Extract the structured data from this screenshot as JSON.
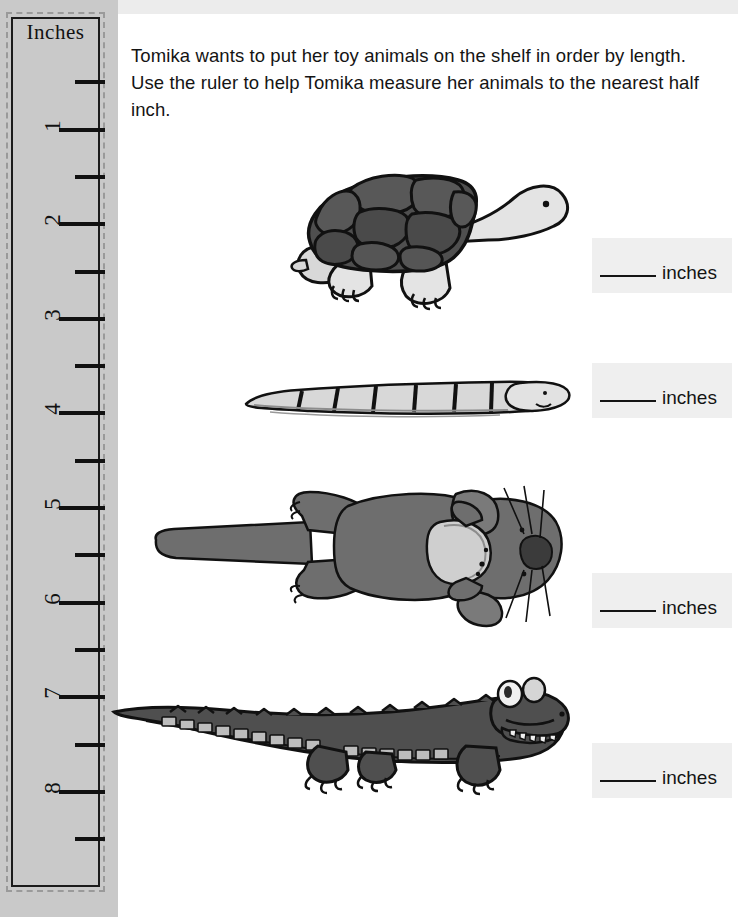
{
  "worksheet": {
    "instructions": "Tomika wants to put her toy animals on the shelf in order by length. Use the ruler to help Tomika measure her animals to the nearest half inch."
  },
  "ruler": {
    "title": "Inches",
    "unit": "inches",
    "whole_labels": [
      "1",
      "2",
      "3",
      "4",
      "5",
      "6",
      "7",
      "8",
      "9"
    ],
    "max_inch": 9,
    "colors": {
      "strip": "#c9c9c9",
      "border": "#1b1b1b",
      "tick": "#111111"
    }
  },
  "answers": [
    {
      "blank": "",
      "unit_label": "inches"
    },
    {
      "blank": "",
      "unit_label": "inches"
    },
    {
      "blank": "",
      "unit_label": "inches"
    },
    {
      "blank": "",
      "unit_label": "inches"
    }
  ],
  "animals": [
    {
      "name": "turtle"
    },
    {
      "name": "snake"
    },
    {
      "name": "otter"
    },
    {
      "name": "alligator"
    }
  ],
  "colors": {
    "dark_gray": "#5e5e5e",
    "darker_gray": "#4a4a4a",
    "light_gray": "#d8d8d8",
    "mid_gray": "#8d8d8d",
    "outline": "#111111",
    "answer_box": "#efefef"
  }
}
